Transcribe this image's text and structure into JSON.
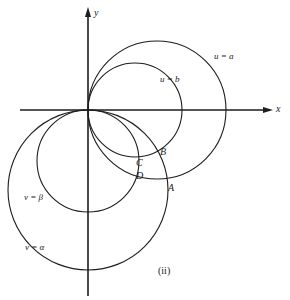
{
  "figure": {
    "caption": "(ii)",
    "axes": {
      "x_label": "x",
      "y_label": "y",
      "origin": [
        88,
        110
      ]
    },
    "curves": [
      {
        "id": "u-eq-a",
        "label": "u = a",
        "type": "circle",
        "center": [
          157,
          110
        ],
        "radius": 69,
        "label_pos": [
          214,
          52
        ]
      },
      {
        "id": "u-eq-b",
        "label": "u = b",
        "type": "circle",
        "center": [
          135,
          110
        ],
        "radius": 47,
        "label_pos": [
          160,
          75
        ]
      },
      {
        "id": "v-eq-beta",
        "label": "v = β",
        "type": "circle",
        "center": [
          88,
          161
        ],
        "radius": 51,
        "label_pos": [
          24,
          193
        ]
      },
      {
        "id": "v-eq-alpha",
        "label": "v = α",
        "type": "circle",
        "center": [
          88,
          190
        ],
        "radius": 80,
        "label_pos": [
          25,
          243
        ]
      }
    ],
    "points": [
      {
        "id": "A",
        "label": "A",
        "label_pos": [
          168,
          183
        ]
      },
      {
        "id": "B",
        "label": "B",
        "label_pos": [
          160,
          147
        ]
      },
      {
        "id": "C",
        "label": "C",
        "label_pos": [
          136,
          158
        ]
      },
      {
        "id": "D",
        "label": "D",
        "label_pos": [
          136,
          171
        ]
      }
    ],
    "colors": {
      "stroke": "#1d1d1d",
      "background": "#ffffff"
    }
  }
}
